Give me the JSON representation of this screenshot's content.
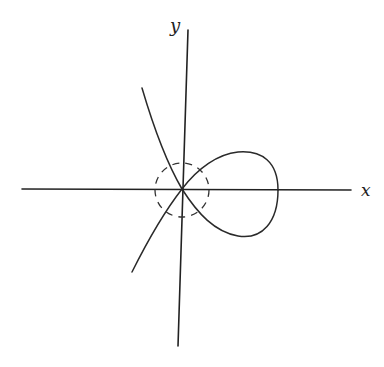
{
  "figure": {
    "title": "",
    "axes": {
      "x_label": "x",
      "y_label": "y"
    },
    "elements": {
      "curve": "nodal cubic with loop",
      "neighborhood": "dashed circle around origin"
    },
    "colors": {
      "ink": "#222222",
      "background": "#ffffff"
    }
  }
}
